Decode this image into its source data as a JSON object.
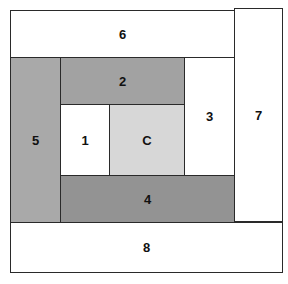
{
  "diagram": {
    "type": "log-cabin quilt block piecing order",
    "blocks": [
      {
        "id": "6",
        "label": "6",
        "x": 10,
        "y": 10,
        "w": 225,
        "h": 48,
        "fill": "#ffffff"
      },
      {
        "id": "7",
        "label": "7",
        "x": 234,
        "y": 8,
        "w": 49,
        "h": 214,
        "fill": "#ffffff"
      },
      {
        "id": "5",
        "label": "5",
        "x": 10,
        "y": 57,
        "w": 51,
        "h": 166,
        "fill": "#a9a9a9"
      },
      {
        "id": "2",
        "label": "2",
        "x": 60,
        "y": 57,
        "w": 125,
        "h": 48,
        "fill": "#a2a2a2"
      },
      {
        "id": "3",
        "label": "3",
        "x": 184,
        "y": 57,
        "w": 51,
        "h": 119,
        "fill": "#ffffff"
      },
      {
        "id": "1",
        "label": "1",
        "x": 60,
        "y": 104,
        "w": 50,
        "h": 72,
        "fill": "#ffffff"
      },
      {
        "id": "C",
        "label": "C",
        "x": 109,
        "y": 104,
        "w": 76,
        "h": 72,
        "fill": "#d7d7d7"
      },
      {
        "id": "4",
        "label": "4",
        "x": 60,
        "y": 175,
        "w": 175,
        "h": 48,
        "fill": "#939393"
      },
      {
        "id": "8",
        "label": "8",
        "x": 10,
        "y": 222,
        "w": 273,
        "h": 51,
        "fill": "#ffffff"
      }
    ],
    "border_color": "#2a2a2a"
  }
}
